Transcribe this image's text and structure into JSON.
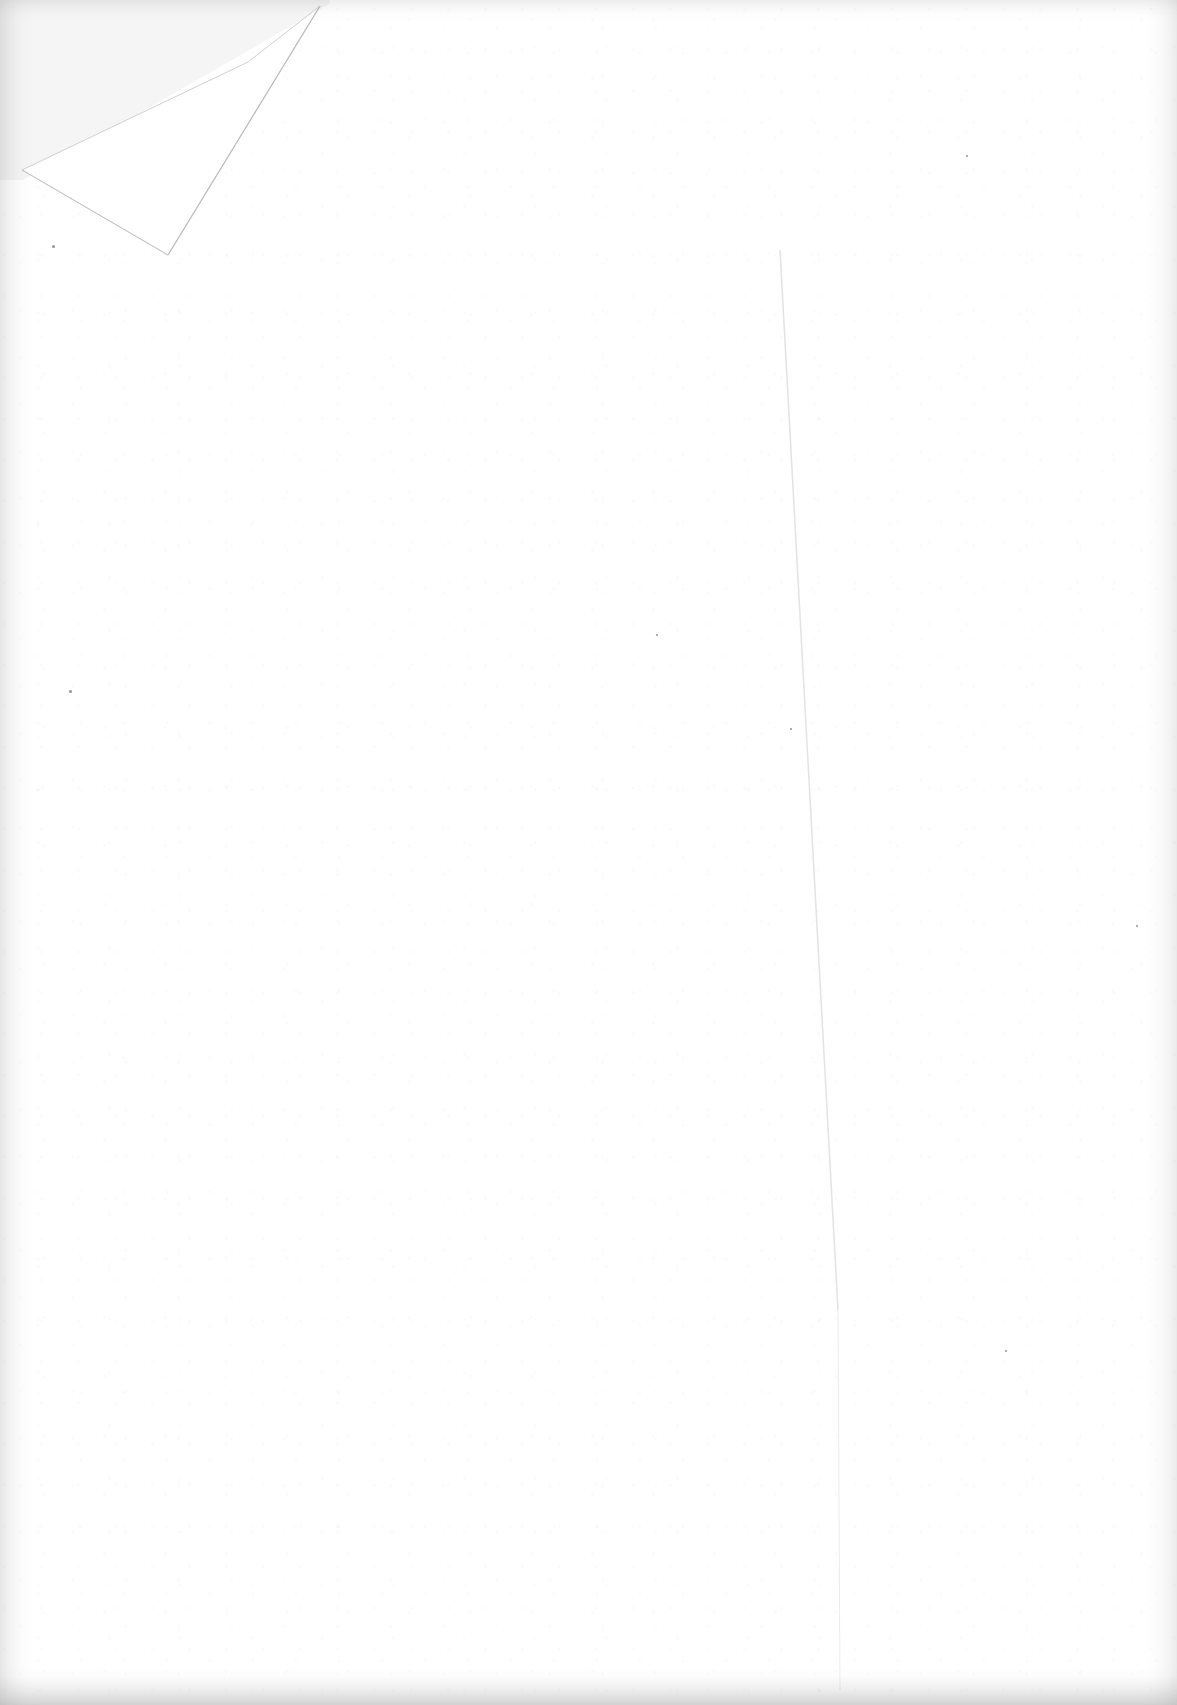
{
  "document": {
    "description": "Blank scanned page",
    "has_text": false,
    "folded_corner": "top-left",
    "crease": "vertical",
    "colors": {
      "paper": "#ffffff",
      "revealed_background": "#f5f5f5",
      "fold_edge": "#c8c8c8",
      "crease": "#e6e6e6",
      "speck": "#3c3c3c"
    }
  }
}
